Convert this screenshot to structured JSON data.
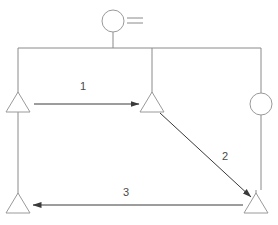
{
  "diagram": {
    "type": "schematic-flow-diagram",
    "canvas": {
      "width": 278,
      "height": 225,
      "background": "#ffffff"
    },
    "style": {
      "line_color": "#8a8a8a",
      "line_width": 1,
      "node_stroke": "#9a9a9a",
      "node_fill": "#ffffff",
      "label_color": "#4a4a4a",
      "arrow_color": "#3a3a3a"
    },
    "nodes": [
      {
        "id": "source",
        "name": "source-circle",
        "shape": "circle",
        "cx": 113,
        "cy": 21,
        "r": 11
      },
      {
        "id": "node-left",
        "name": "triangle-left",
        "shape": "triangle",
        "cx": 18,
        "cy": 104,
        "size": 15
      },
      {
        "id": "node-center",
        "name": "triangle-center",
        "shape": "triangle",
        "cx": 152,
        "cy": 104,
        "size": 15
      },
      {
        "id": "node-right",
        "name": "circle-right",
        "shape": "circle",
        "cx": 261,
        "cy": 104,
        "r": 11
      },
      {
        "id": "node-bottom-left",
        "name": "triangle-bottom-left",
        "shape": "triangle",
        "cx": 18,
        "cy": 205,
        "size": 15
      },
      {
        "id": "node-bottom-right",
        "name": "triangle-bottom-right",
        "shape": "triangle",
        "cx": 256,
        "cy": 205,
        "size": 15
      }
    ],
    "edges": [
      {
        "id": "edge-1",
        "name": "arrow-left-to-center",
        "label": "1",
        "from": "node-left",
        "to": "node-center",
        "label_x": 83,
        "label_y": 90
      },
      {
        "id": "edge-2",
        "name": "arrow-center-to-bottom-right",
        "label": "2",
        "from": "node-center",
        "to": "node-bottom-right",
        "label_x": 225,
        "label_y": 160
      },
      {
        "id": "edge-3",
        "name": "arrow-bottom-right-to-bottom-left",
        "label": "3",
        "from": "node-bottom-right",
        "to": "node-bottom-left",
        "label_x": 126,
        "label_y": 196
      }
    ],
    "connectors": [
      {
        "name": "source-stem",
        "points": "113,32 113,48"
      },
      {
        "name": "top-rail",
        "points": "18,48 261,48"
      },
      {
        "name": "center-drop",
        "points": "152,48 152,96"
      },
      {
        "name": "left-rail-upper",
        "points": "18,48 18,96"
      },
      {
        "name": "left-rail-lower",
        "points": "18,112 18,197"
      },
      {
        "name": "right-rail-upper",
        "points": "261,48 261,93"
      },
      {
        "name": "right-rail-lower",
        "points": "261,115 261,190"
      },
      {
        "name": "bottom-right-stem",
        "points": "256,190 256,197"
      }
    ],
    "source_marks": {
      "name": "equals-marks",
      "lines": [
        {
          "x1": 127,
          "y1": 18,
          "x2": 143,
          "y2": 18
        },
        {
          "x1": 127,
          "y1": 23,
          "x2": 143,
          "y2": 23
        }
      ]
    },
    "labels": {
      "one": "1",
      "two": "2",
      "three": "3"
    }
  }
}
